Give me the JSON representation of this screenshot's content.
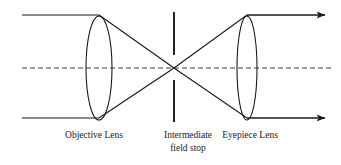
{
  "figure": {
    "background_color": "#ffffff",
    "line_color": "#1a1a1a",
    "axis_color": "#3a3a6a",
    "width": 341,
    "height": 165
  },
  "labels": {
    "objective": "Objective Lens",
    "field_stop_line1": "Intermediate",
    "field_stop_line2": "field stop",
    "eyepiece": "Eyepiece Lens"
  },
  "geometry": {
    "optical_axis_y": 68,
    "top_ray_y": 15,
    "bottom_ray_y": 118,
    "objective_center_x": 99,
    "objective_rx": 13,
    "objective_ry": 52,
    "field_stop_x": 174,
    "field_stop_upper_top": 12,
    "field_stop_upper_bottom": 55,
    "field_stop_lower_top": 80,
    "field_stop_lower_bottom": 122,
    "eyepiece_center_x": 247,
    "eyepiece_rx": 10,
    "eyepiece_ry": 52,
    "ray_start_x": 22,
    "arrow_tip_x": 327,
    "crossing_x": 174,
    "crossing_y": 68
  },
  "elements": {
    "incoming_top_ray": "incoming collimated ray, upper",
    "incoming_bottom_ray": "incoming collimated ray, lower",
    "outgoing_top_ray": "outgoing collimated ray, upper",
    "outgoing_bottom_ray": "outgoing collimated ray, lower",
    "converging_rays": "rays converging to intermediate focus",
    "diverging_rays": "rays diverging from intermediate focus"
  }
}
